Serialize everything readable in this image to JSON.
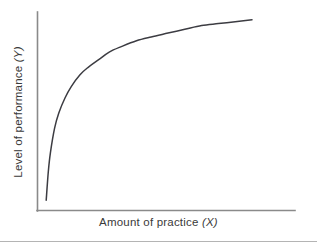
{
  "figure": {
    "background_color": "#ffffff",
    "axis_color": "#8a8a8a",
    "curve_color": "#3c3c42",
    "text_color": "#3a3a3a",
    "rule_color": "#b4b4b4"
  },
  "labels": {
    "x_axis_text": "Amount of practice",
    "x_axis_variable": "(X)",
    "y_axis_text": "Level of performance",
    "y_axis_variable": "(Y)"
  },
  "chart_data": {
    "type": "line",
    "title": "",
    "subtitle": "",
    "xlabel": "Amount of practice (X)",
    "ylabel": "Level of performance (Y)",
    "grid": false,
    "legend": null,
    "axis_ticks": {
      "x": [],
      "y": []
    },
    "xlim": [
      0,
      100
    ],
    "ylim": [
      0,
      100
    ],
    "annotations": [],
    "series": [
      {
        "name": "Learning curve",
        "shape": "negatively accelerated power curve",
        "x": [
          2,
          3,
          4,
          6,
          8,
          11,
          14,
          18,
          22,
          27,
          32,
          38,
          45,
          52,
          60,
          68,
          76,
          84,
          92,
          100
        ],
        "y": [
          3,
          18,
          28,
          41,
          49,
          57,
          63,
          69,
          73,
          77,
          81,
          84,
          87,
          89,
          91,
          93,
          95,
          96,
          97,
          98
        ]
      }
    ]
  }
}
